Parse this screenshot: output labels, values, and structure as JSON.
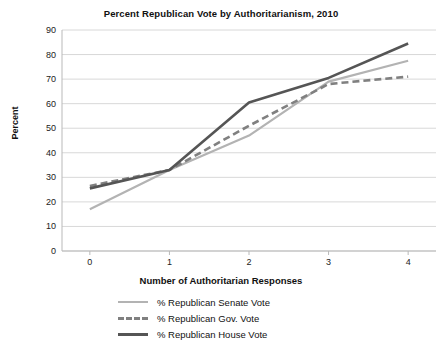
{
  "chart_data": {
    "type": "line",
    "title": "Percent Republican Vote by Authoritarianism, 2010",
    "xlabel": "Number of Authoritarian Responses",
    "ylabel": "Percent",
    "x": [
      0,
      1,
      2,
      3,
      4
    ],
    "xticklabels": [
      "0",
      "1",
      "2",
      "3",
      "4"
    ],
    "yticklabels": [
      "0",
      "10",
      "20",
      "30",
      "40",
      "50",
      "60",
      "70",
      "80",
      "90"
    ],
    "ylim": [
      0,
      90
    ],
    "xlim": [
      -0.35,
      4.35
    ],
    "grid": "horizontal",
    "legend_position": "below",
    "series": [
      {
        "name": "% Republican Senate Vote",
        "values": [
          17,
          33,
          47,
          69,
          77.5
        ],
        "color": "#b3b3b3",
        "style": "solid",
        "width": 2.2
      },
      {
        "name": "% Republican Gov. Vote",
        "values": [
          26.5,
          33,
          51,
          68,
          71
        ],
        "color": "#808080",
        "style": "dashed",
        "width": 2.6
      },
      {
        "name": "% Republican House Vote",
        "values": [
          25.5,
          33,
          60.5,
          70.5,
          84.5
        ],
        "color": "#555555",
        "style": "solid",
        "width": 2.6
      }
    ]
  },
  "legend": {
    "items": [
      {
        "label": "% Republican Senate Vote"
      },
      {
        "label": "% Republican Gov. Vote"
      },
      {
        "label": "% Republican House Vote"
      }
    ]
  }
}
